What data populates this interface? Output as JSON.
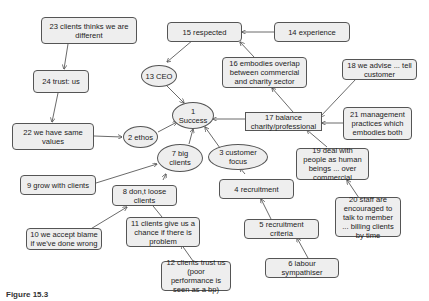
{
  "diagram": {
    "type": "cause-map",
    "nodes": [
      {
        "id": "n1",
        "label": "1 Success",
        "shape": "ellipse"
      },
      {
        "id": "n2",
        "label": "2 ethos",
        "shape": "ellipse"
      },
      {
        "id": "n3",
        "label": "3 customer focus",
        "shape": "ellipse"
      },
      {
        "id": "n4",
        "label": "4 recruitment",
        "shape": "rbox"
      },
      {
        "id": "n5",
        "label": "5 recruitment criteria",
        "shape": "rbox"
      },
      {
        "id": "n6",
        "label": "6 labour sympathiser",
        "shape": "rbox"
      },
      {
        "id": "n7",
        "label": "7 big clients",
        "shape": "ellipse"
      },
      {
        "id": "n8",
        "label": "8 don,t loose clients",
        "shape": "rbox"
      },
      {
        "id": "n9",
        "label": "9 grow with clients",
        "shape": "rbox"
      },
      {
        "id": "n10",
        "label": "10 we accept blame if we've done wrong",
        "shape": "rbox"
      },
      {
        "id": "n11",
        "label": "11 clients give us a chance if there is problem",
        "shape": "rbox"
      },
      {
        "id": "n12",
        "label": "12 clients trust us (poor performance is seen as a bp)",
        "shape": "rbox"
      },
      {
        "id": "n13",
        "label": "13 CEO",
        "shape": "ellipse"
      },
      {
        "id": "n14",
        "label": "14 experience",
        "shape": "rbox"
      },
      {
        "id": "n15",
        "label": "15 respected",
        "shape": "rbox"
      },
      {
        "id": "n16",
        "label": "16 embodies overlap between commercial and charity sector",
        "shape": "rbox"
      },
      {
        "id": "n17",
        "label": "17 balance charity/professional",
        "shape": "sq"
      },
      {
        "id": "n18",
        "label": "18 we advise ... tell customer",
        "shape": "rbox"
      },
      {
        "id": "n19",
        "label": "19 deal with people as human beings ... over commercial",
        "shape": "rbox"
      },
      {
        "id": "n20",
        "label": "20 staff are encouraged to talk to member ... billing clients by time",
        "shape": "rbox"
      },
      {
        "id": "n21",
        "label": "21 management practices which embodies both",
        "shape": "rbox"
      },
      {
        "id": "n22",
        "label": "22 we have same values",
        "shape": "rbox"
      },
      {
        "id": "n23",
        "label": "23 clients thinks we are different",
        "shape": "rbox"
      },
      {
        "id": "n24",
        "label": "24 trust: us",
        "shape": "rbox"
      }
    ],
    "edges": [
      [
        "n23",
        "n24"
      ],
      [
        "n24",
        "n22"
      ],
      [
        "n22",
        "n2"
      ],
      [
        "n2",
        "n1"
      ],
      [
        "n13",
        "n1"
      ],
      [
        "n15",
        "n13"
      ],
      [
        "n14",
        "n15"
      ],
      [
        "n16",
        "n15"
      ],
      [
        "n17",
        "n16"
      ],
      [
        "n17",
        "n1"
      ],
      [
        "n18",
        "n17"
      ],
      [
        "n21",
        "n17"
      ],
      [
        "n19",
        "n17"
      ],
      [
        "n20",
        "n19"
      ],
      [
        "n3",
        "n1"
      ],
      [
        "n4",
        "n3"
      ],
      [
        "n5",
        "n4"
      ],
      [
        "n6",
        "n5"
      ],
      [
        "n7",
        "n1"
      ],
      [
        "n9",
        "n7"
      ],
      [
        "n8",
        "n7"
      ],
      [
        "n10",
        "n8"
      ],
      [
        "n11",
        "n8"
      ],
      [
        "n12",
        "n11"
      ]
    ]
  },
  "caption": "Figure 15.3"
}
